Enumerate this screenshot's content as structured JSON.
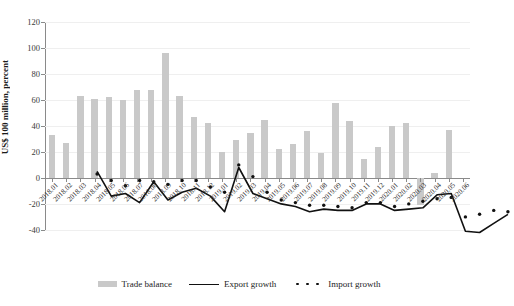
{
  "chart_data": {
    "type": "bar",
    "title": "",
    "subtitle": "",
    "xlabel": "",
    "ylabel": "US$ 100 million, percent",
    "ylim": [
      -40,
      120
    ],
    "yticks": [
      -40,
      -20,
      0,
      20,
      40,
      60,
      80,
      100,
      120
    ],
    "grid": true,
    "legend_position": "bottom",
    "categories": [
      "2018.01",
      "2018.02",
      "2018.03",
      "2018.04",
      "2018.05",
      "2018.06",
      "2018.07",
      "2018.08",
      "2018.09",
      "2018.10",
      "2018.11",
      "2018.12",
      "2019.01",
      "2019.02",
      "2019.03",
      "2019.04",
      "2019.05",
      "2019.06",
      "2019.07",
      "2019.08",
      "2019.09",
      "2019.10",
      "2019.11",
      "2019.12",
      "2020.01",
      "2020.02",
      "2020.03",
      "2020.04",
      "2020.05",
      "2020.06"
    ],
    "series": [
      {
        "name": "Trade balance",
        "type": "bar",
        "color": "#c9c9c9",
        "values": [
          33,
          27,
          63,
          61,
          62,
          60,
          68,
          68,
          96,
          63,
          47,
          42,
          20,
          29,
          35,
          45,
          22,
          26,
          36,
          19,
          58,
          44,
          15,
          24,
          40,
          42,
          -21,
          4,
          37,
          0
        ]
      },
      {
        "name": "Export growth",
        "type": "line",
        "style": "solid",
        "color": "#111111",
        "values": [
          22,
          3,
          5,
          -2,
          14,
          0,
          6,
          9,
          3,
          -9,
          25,
          5,
          1,
          -3,
          -5,
          -9,
          -7,
          -8,
          -8,
          -3,
          -3,
          -8,
          -7,
          -6,
          4,
          5,
          -24,
          -25,
          -18,
          -11
        ]
      },
      {
        "name": "Import growth",
        "type": "line",
        "style": "dotted",
        "color": "#111111",
        "values": [
          20,
          15,
          11,
          15,
          14,
          12,
          15,
          15,
          10,
          6,
          27,
          18,
          6,
          0,
          -2,
          -4,
          -4,
          -5,
          -6,
          -2,
          -2,
          -5,
          -3,
          -1,
          1,
          2,
          -13,
          -11,
          -8,
          -9
        ]
      }
    ]
  },
  "legend": {
    "items": [
      {
        "label": "Trade balance",
        "marker": "bar-swatch"
      },
      {
        "label": "Export growth",
        "marker": "solid-line"
      },
      {
        "label": "Import growth",
        "marker": "dotted-line"
      }
    ]
  }
}
